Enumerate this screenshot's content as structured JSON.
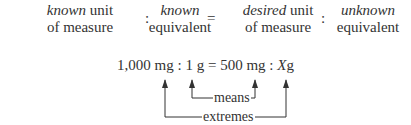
{
  "header": {
    "terms": [
      {
        "top_italic": "known",
        "top_plain": " unit",
        "bottom": "of measure"
      },
      {
        "top_italic": "known",
        "top_plain": "",
        "bottom": "equivalent"
      },
      {
        "top_italic": "desired",
        "top_plain": " unit",
        "bottom": "of measure"
      },
      {
        "top_italic": "unknown",
        "top_plain": "",
        "bottom": "equivalent"
      }
    ],
    "separators": [
      ":",
      "=",
      ":"
    ]
  },
  "equation": {
    "part1": "1,000 mg : 1 g = 500 mg : ",
    "variable": "X",
    "unit": "g"
  },
  "annotations": {
    "means_label": "means",
    "extremes_label": "extremes"
  }
}
